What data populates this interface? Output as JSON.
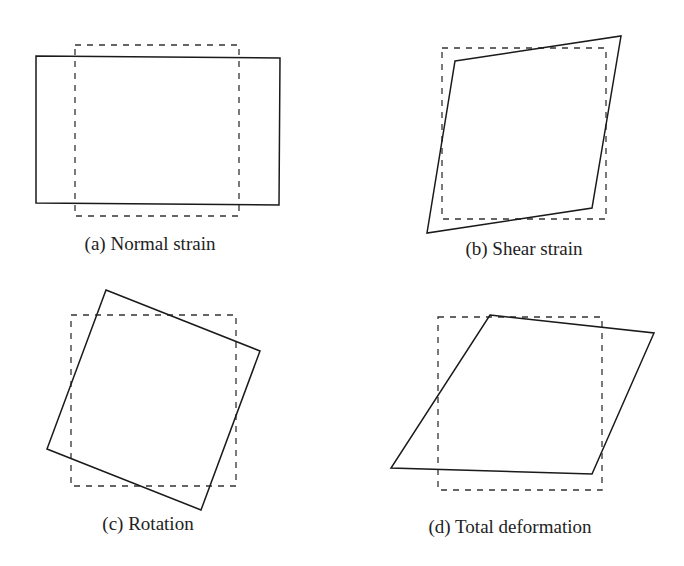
{
  "figure": {
    "panels": [
      {
        "id": "a",
        "caption": "(a) Normal strain",
        "caption_pos": [
          150,
          250
        ],
        "reference_rect": [
          [
            75,
            45
          ],
          [
            239,
            45
          ],
          [
            239,
            216
          ],
          [
            75,
            216
          ]
        ],
        "deformed_shape": [
          [
            36,
            56
          ],
          [
            280,
            58
          ],
          [
            279,
            205
          ],
          [
            36,
            203
          ]
        ]
      },
      {
        "id": "b",
        "caption": "(b) Shear strain",
        "caption_pos": [
          524,
          255
        ],
        "reference_rect": [
          [
            442,
            48
          ],
          [
            606,
            48
          ],
          [
            606,
            219
          ],
          [
            442,
            219
          ]
        ],
        "deformed_shape": [
          [
            455,
            61
          ],
          [
            621,
            36
          ],
          [
            592,
            208
          ],
          [
            427,
            233
          ]
        ]
      },
      {
        "id": "c",
        "caption": "(c) Rotation",
        "caption_pos": [
          148,
          530
        ],
        "reference_rect": [
          [
            71,
            315
          ],
          [
            236,
            315
          ],
          [
            236,
            486
          ],
          [
            71,
            486
          ]
        ],
        "deformed_shape": [
          [
            106,
            290
          ],
          [
            260,
            351
          ],
          [
            201,
            510
          ],
          [
            47,
            449
          ]
        ]
      },
      {
        "id": "d",
        "caption": "(d) Total deformation",
        "caption_pos": [
          510,
          533
        ],
        "reference_rect": [
          [
            438,
            317
          ],
          [
            602,
            317
          ],
          [
            602,
            490
          ],
          [
            438,
            490
          ]
        ],
        "deformed_shape": [
          [
            490,
            315
          ],
          [
            654,
            333
          ],
          [
            592,
            474
          ],
          [
            391,
            468
          ]
        ]
      }
    ],
    "legend": {
      "dashed": "reference (undeformed) element",
      "solid": "deformed element"
    },
    "colors": {
      "stroke": "#1a1a1a",
      "background": "#ffffff"
    }
  }
}
